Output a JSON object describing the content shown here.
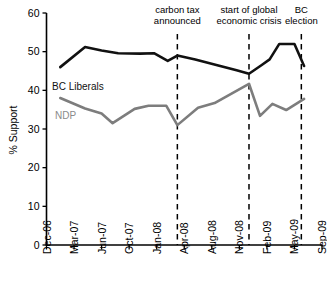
{
  "chart_data": {
    "type": "line",
    "title": "",
    "xlabel": "",
    "ylabel": "% Support",
    "ylim": [
      0,
      60
    ],
    "ytick_labels": [
      "0",
      "10",
      "20",
      "30",
      "40",
      "50",
      "60"
    ],
    "ytick_values": [
      0,
      10,
      20,
      30,
      40,
      50,
      60
    ],
    "grid": false,
    "legend_position": "inline-labels",
    "x": [
      "Dec-06",
      "Mar-07",
      "Jun-07",
      "Oct-07",
      "Jan-08",
      "Apr-08",
      "Aug-08",
      "Nov-08",
      "Feb-09",
      "May-09",
      "Sep-09"
    ],
    "xtick_labels": [
      "Dec-06",
      "Mar-07",
      "Jun-07",
      "Oct-07",
      "Jan-08",
      "Apr-08",
      "Aug-08",
      "Nov-08",
      "Feb-09",
      "May-09",
      "Sep-09"
    ],
    "series": [
      {
        "name": "BC Liberals",
        "color": "#111111",
        "label_text": "BC Liberals",
        "points": [
          {
            "t": 0.5,
            "v": 46.0
          },
          {
            "t": 1.4,
            "v": 51.2
          },
          {
            "t": 2.0,
            "v": 50.3
          },
          {
            "t": 2.6,
            "v": 49.6
          },
          {
            "t": 3.4,
            "v": 49.5
          },
          {
            "t": 3.9,
            "v": 49.6
          },
          {
            "t": 4.4,
            "v": 47.6
          },
          {
            "t": 4.75,
            "v": 49.0
          },
          {
            "t": 5.4,
            "v": 48.0
          },
          {
            "t": 6.2,
            "v": 46.5
          },
          {
            "t": 6.9,
            "v": 45.2
          },
          {
            "t": 7.35,
            "v": 44.3
          },
          {
            "t": 7.8,
            "v": 46.5
          },
          {
            "t": 8.1,
            "v": 48.0
          },
          {
            "t": 8.45,
            "v": 52.0
          },
          {
            "t": 9.0,
            "v": 52.0
          },
          {
            "t": 9.35,
            "v": 46.3
          }
        ]
      },
      {
        "name": "NDP",
        "color": "#7d7d7d",
        "label_text": "NDP",
        "points": [
          {
            "t": 0.5,
            "v": 38.0
          },
          {
            "t": 1.4,
            "v": 35.3
          },
          {
            "t": 2.0,
            "v": 34.0
          },
          {
            "t": 2.4,
            "v": 31.5
          },
          {
            "t": 3.2,
            "v": 35.2
          },
          {
            "t": 3.7,
            "v": 36.0
          },
          {
            "t": 4.35,
            "v": 36.0
          },
          {
            "t": 4.75,
            "v": 31.0
          },
          {
            "t": 5.5,
            "v": 35.5
          },
          {
            "t": 6.1,
            "v": 36.7
          },
          {
            "t": 7.35,
            "v": 41.7
          },
          {
            "t": 7.75,
            "v": 33.4
          },
          {
            "t": 8.2,
            "v": 36.5
          },
          {
            "t": 8.7,
            "v": 34.9
          },
          {
            "t": 9.35,
            "v": 37.8
          }
        ]
      }
    ],
    "annotations": [
      {
        "name": "carbon-tax",
        "line1": "carbon tax",
        "line2": "announced",
        "t": 4.75
      },
      {
        "name": "economic-crisis",
        "line1": "start of global",
        "line2": "economic crisis",
        "t": 7.35
      },
      {
        "name": "bc-election",
        "line1": "BC",
        "line2": "election",
        "t": 9.25
      }
    ]
  }
}
